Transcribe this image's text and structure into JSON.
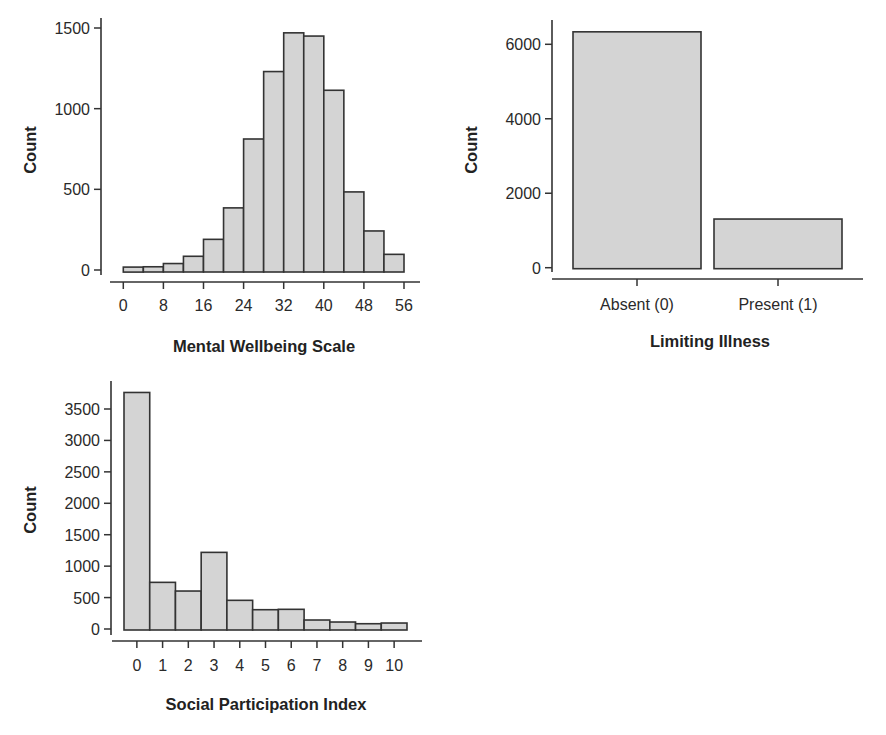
{
  "chart_data": [
    {
      "id": "wellbeing",
      "type": "bar",
      "subtype": "histogram",
      "title": "",
      "xlabel": "Mental Wellbeing Scale",
      "ylabel": "Count",
      "bin_edges": [
        0,
        4,
        8,
        12,
        16,
        20,
        24,
        28,
        32,
        36,
        40,
        44,
        48,
        52,
        56
      ],
      "values": [
        18,
        20,
        40,
        85,
        190,
        385,
        812,
        1230,
        1470,
        1450,
        1114,
        484,
        242,
        97
      ],
      "xticks": [
        0,
        8,
        16,
        24,
        32,
        40,
        48,
        56
      ],
      "xtick_labels": [
        "0",
        "8",
        "16",
        "24",
        "32",
        "40",
        "48",
        "56"
      ],
      "yticks": [
        0,
        500,
        1000,
        1500
      ],
      "ytick_labels": [
        "0",
        "500",
        "1000",
        "1500"
      ],
      "xlim": [
        0,
        56
      ],
      "ylim": [
        0,
        1500
      ],
      "grid": false,
      "colors": {
        "fill": "#d4d4d4",
        "stroke": "#333333"
      }
    },
    {
      "id": "illness",
      "type": "bar",
      "title": "",
      "xlabel": "Limiting Illness",
      "ylabel": "Count",
      "categories": [
        "Absent (0)",
        "Present (1)"
      ],
      "values": [
        6335,
        1307
      ],
      "yticks": [
        0,
        2000,
        4000,
        6000
      ],
      "ytick_labels": [
        "0",
        "2000",
        "4000",
        "6000"
      ],
      "ylim": [
        0,
        6000
      ],
      "grid": false,
      "colors": {
        "fill": "#d4d4d4",
        "stroke": "#333333"
      }
    },
    {
      "id": "participation",
      "type": "bar",
      "title": "",
      "xlabel": "Social Participation Index",
      "ylabel": "Count",
      "categories": [
        "0",
        "1",
        "2",
        "3",
        "4",
        "5",
        "6",
        "7",
        "8",
        "9",
        "10"
      ],
      "values": [
        3763,
        742,
        604,
        1219,
        456,
        307,
        313,
        143,
        111,
        84,
        95
      ],
      "yticks": [
        0,
        500,
        1000,
        1500,
        2000,
        2500,
        3000,
        3500
      ],
      "ytick_labels": [
        "0",
        "500",
        "1000",
        "1500",
        "2000",
        "2500",
        "3000",
        "3500"
      ],
      "ylim": [
        0,
        3500
      ],
      "grid": false,
      "colors": {
        "fill": "#d4d4d4",
        "stroke": "#333333"
      }
    }
  ]
}
